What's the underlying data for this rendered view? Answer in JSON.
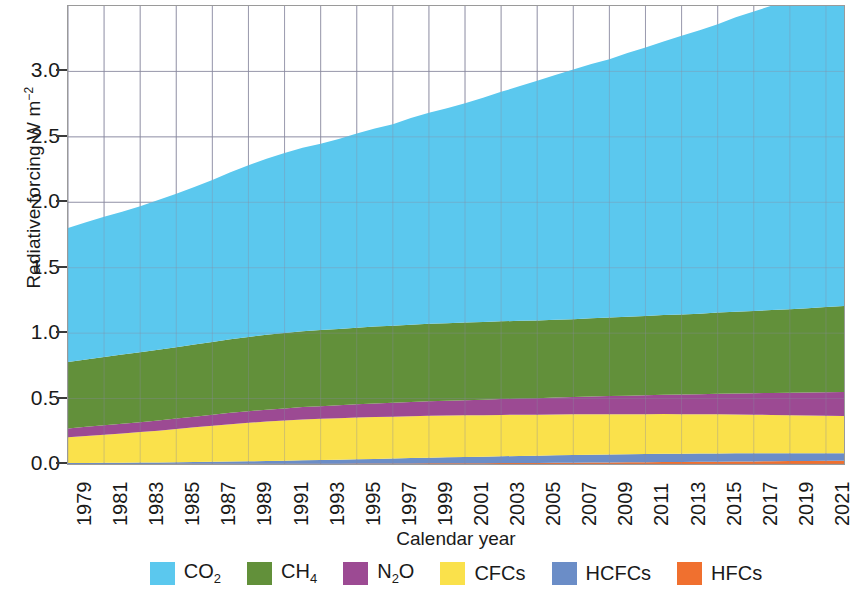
{
  "chart_data": {
    "type": "area",
    "stacked": true,
    "title": "",
    "xlabel": "Calendar year",
    "ylabel": "Radiative forcing W m-2",
    "ylabel_html": "Radiative forcing W m<sup>&#8722;2</sup>",
    "xlim": [
      1979,
      2022
    ],
    "ylim": [
      0.0,
      3.5
    ],
    "yticks": [
      "0.0",
      "0.5",
      "1.0",
      "1.5",
      "2.0",
      "2.5",
      "3.0"
    ],
    "ytick_values": [
      0.0,
      0.5,
      1.0,
      1.5,
      2.0,
      2.5,
      3.0
    ],
    "grid": true,
    "legend_position": "bottom",
    "x": [
      1979,
      1980,
      1981,
      1982,
      1983,
      1984,
      1985,
      1986,
      1987,
      1988,
      1989,
      1990,
      1991,
      1992,
      1993,
      1994,
      1995,
      1996,
      1997,
      1998,
      1999,
      2000,
      2001,
      2002,
      2003,
      2004,
      2005,
      2006,
      2007,
      2008,
      2009,
      2010,
      2011,
      2012,
      2013,
      2014,
      2015,
      2016,
      2017,
      2018,
      2019,
      2020,
      2021,
      2022
    ],
    "xtick_labels": [
      "1979",
      "1981",
      "1983",
      "1985",
      "1987",
      "1989",
      "1991",
      "1993",
      "1995",
      "1997",
      "1999",
      "2001",
      "2003",
      "2005",
      "2007",
      "2009",
      "2011",
      "2013",
      "2015",
      "2017",
      "2019",
      "2021"
    ],
    "series": [
      {
        "name": "HFCs",
        "color": "#f0702f",
        "values": [
          0.0,
          0.0,
          0.0,
          0.0,
          0.0,
          0.0,
          0.001,
          0.001,
          0.001,
          0.001,
          0.001,
          0.001,
          0.001,
          0.002,
          0.002,
          0.002,
          0.003,
          0.003,
          0.004,
          0.004,
          0.005,
          0.005,
          0.006,
          0.006,
          0.007,
          0.008,
          0.008,
          0.009,
          0.01,
          0.011,
          0.012,
          0.013,
          0.014,
          0.015,
          0.016,
          0.017,
          0.018,
          0.019,
          0.02,
          0.021,
          0.022,
          0.023,
          0.024,
          0.025
        ]
      },
      {
        "name": "HCFCs",
        "color": "#6b8dc7",
        "values": [
          0.007,
          0.008,
          0.009,
          0.01,
          0.011,
          0.012,
          0.013,
          0.015,
          0.016,
          0.018,
          0.02,
          0.022,
          0.024,
          0.026,
          0.028,
          0.031,
          0.033,
          0.036,
          0.038,
          0.041,
          0.043,
          0.046,
          0.048,
          0.05,
          0.052,
          0.054,
          0.055,
          0.057,
          0.058,
          0.059,
          0.06,
          0.061,
          0.062,
          0.063,
          0.063,
          0.063,
          0.063,
          0.063,
          0.062,
          0.061,
          0.06,
          0.059,
          0.058,
          0.057
        ]
      },
      {
        "name": "CFCs",
        "color": "#fae14b",
        "values": [
          0.197,
          0.206,
          0.215,
          0.224,
          0.233,
          0.243,
          0.253,
          0.264,
          0.275,
          0.285,
          0.294,
          0.301,
          0.307,
          0.312,
          0.315,
          0.317,
          0.319,
          0.32,
          0.32,
          0.32,
          0.32,
          0.319,
          0.318,
          0.317,
          0.316,
          0.315,
          0.314,
          0.313,
          0.312,
          0.31,
          0.309,
          0.307,
          0.305,
          0.304,
          0.302,
          0.3,
          0.299,
          0.297,
          0.295,
          0.293,
          0.291,
          0.289,
          0.287,
          0.285
        ]
      },
      {
        "name": "N2O",
        "color": "#9c4a93",
        "values": [
          0.068,
          0.07,
          0.072,
          0.074,
          0.076,
          0.078,
          0.08,
          0.082,
          0.085,
          0.087,
          0.089,
          0.091,
          0.093,
          0.095,
          0.097,
          0.099,
          0.102,
          0.104,
          0.106,
          0.108,
          0.111,
          0.113,
          0.116,
          0.118,
          0.121,
          0.123,
          0.126,
          0.129,
          0.132,
          0.135,
          0.138,
          0.141,
          0.144,
          0.147,
          0.15,
          0.153,
          0.157,
          0.16,
          0.164,
          0.168,
          0.172,
          0.176,
          0.18,
          0.184
        ]
      },
      {
        "name": "CH4",
        "color": "#62903a",
        "values": [
          0.508,
          0.515,
          0.521,
          0.528,
          0.534,
          0.54,
          0.546,
          0.551,
          0.556,
          0.562,
          0.567,
          0.572,
          0.576,
          0.579,
          0.582,
          0.583,
          0.585,
          0.587,
          0.588,
          0.591,
          0.592,
          0.593,
          0.593,
          0.594,
          0.594,
          0.594,
          0.594,
          0.594,
          0.595,
          0.598,
          0.601,
          0.604,
          0.606,
          0.609,
          0.612,
          0.616,
          0.62,
          0.625,
          0.629,
          0.633,
          0.637,
          0.643,
          0.65,
          0.656
        ]
      },
      {
        "name": "CO2",
        "color": "#5bc8ee",
        "values": [
          1.024,
          1.049,
          1.072,
          1.092,
          1.115,
          1.144,
          1.173,
          1.203,
          1.238,
          1.277,
          1.312,
          1.345,
          1.376,
          1.403,
          1.424,
          1.451,
          1.484,
          1.513,
          1.541,
          1.58,
          1.614,
          1.643,
          1.676,
          1.713,
          1.754,
          1.792,
          1.831,
          1.871,
          1.907,
          1.943,
          1.974,
          2.014,
          2.051,
          2.09,
          2.129,
          2.166,
          2.203,
          2.25,
          2.288,
          2.327,
          2.366,
          2.404,
          2.44,
          2.477
        ]
      }
    ],
    "totals_note": "Stacked order bottom to top: HFCs, HCFCs, CFCs, N2O, CH4, CO2"
  },
  "legend": {
    "items": [
      {
        "label_html": "CO<sub>2</sub>",
        "label": "CO2",
        "color": "#5bc8ee"
      },
      {
        "label_html": "CH<sub>4</sub>",
        "label": "CH4",
        "color": "#62903a"
      },
      {
        "label_html": "N<sub>2</sub>O",
        "label": "N2O",
        "color": "#9c4a93"
      },
      {
        "label_html": "CFCs",
        "label": "CFCs",
        "color": "#fae14b"
      },
      {
        "label_html": "HCFCs",
        "label": "HCFCs",
        "color": "#6b8dc7"
      },
      {
        "label_html": "HFCs",
        "label": "HFCs",
        "color": "#f0702f"
      }
    ]
  },
  "axes": {
    "x_title": "Calendar year",
    "grid_color": "#8a8aa0",
    "frame_color": "#9a9a9a"
  }
}
